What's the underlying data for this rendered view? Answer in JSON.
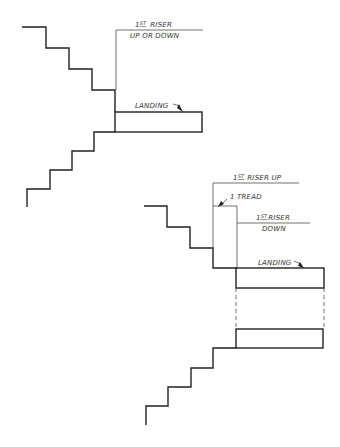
{
  "diagram": {
    "type": "stair-landing-elevation",
    "colors": {
      "line": "#222222",
      "text": "#333333",
      "background": "#ffffff"
    },
    "top_figure": {
      "label_riser_num": "1",
      "label_riser_sup": "ST",
      "label_riser": "RISER",
      "label_riser_sub": "UP OR DOWN",
      "label_landing": "LANDING"
    },
    "bottom_figure": {
      "riser_up_num": "1",
      "riser_up_sup": "ST",
      "riser_up_text": "RISER UP",
      "tread_label": "1 TREAD",
      "riser_down_num": "1",
      "riser_down_sup": "ST",
      "riser_down_text": "RISER",
      "riser_down_sub": "DOWN",
      "label_landing": "LANDING"
    }
  }
}
